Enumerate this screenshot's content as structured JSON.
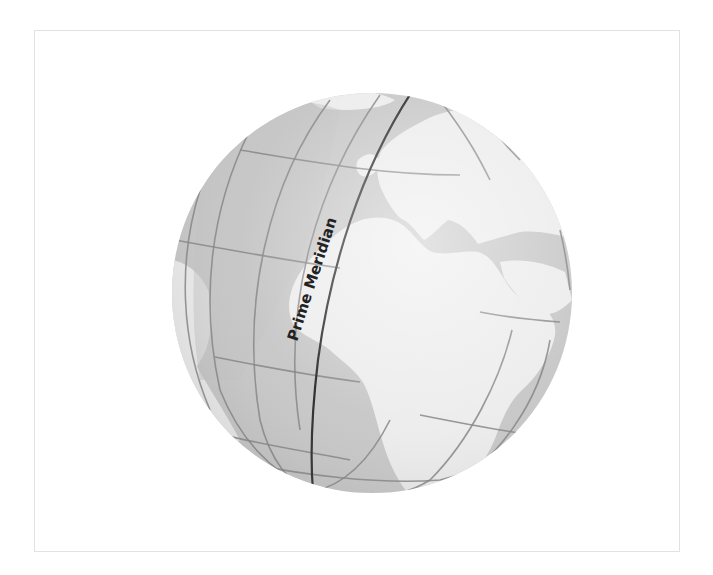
{
  "figure": {
    "type": "globe-illustration",
    "label": "Prime Meridian",
    "colors": {
      "ocean": "#c4c4c4",
      "land": "#ececec",
      "grid_line": "#7a7a7a",
      "prime_meridian": "#1a1a1a",
      "frame_border": "#e2e2e2",
      "background": "#ffffff"
    },
    "regions_depicted": [
      "Europe",
      "Africa",
      "Mediterranean",
      "Atlantic Ocean",
      "Arabian Peninsula"
    ]
  }
}
